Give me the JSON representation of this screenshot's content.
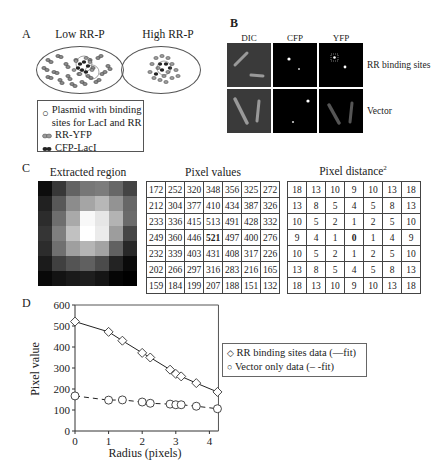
{
  "panel_a": {
    "letter": "A",
    "low_title": "Low RR-P",
    "high_title": "High RR-P",
    "legend": [
      {
        "icon": "open-circle-icon",
        "label": "Plasmid with binding sites for LacI and RR"
      },
      {
        "icon": "gray-dimer-icon",
        "label": "RR-YFP"
      },
      {
        "icon": "black-dimer-icon",
        "label": "CFP-LacI"
      }
    ],
    "legend_line1": "Plasmid with binding",
    "legend_line2": "sites for LacI and RR",
    "legend_rr": "RR-YFP",
    "legend_cfp": "CFP-LacI"
  },
  "panel_b": {
    "letter": "B",
    "columns": [
      "DIC",
      "CFP",
      "YFP"
    ],
    "rows": [
      "RR binding sites",
      "Vector"
    ]
  },
  "panel_c": {
    "letter": "C",
    "extracted_title": "Extracted region",
    "pixel_values_title": "Pixel values",
    "pixel_distance_title": "Pixel distance",
    "pixel_distance_sup": "2",
    "pixel_values": [
      [
        172,
        252,
        320,
        348,
        356,
        325,
        272
      ],
      [
        212,
        304,
        377,
        410,
        434,
        387,
        326
      ],
      [
        233,
        336,
        415,
        513,
        491,
        428,
        332
      ],
      [
        249,
        360,
        446,
        521,
        497,
        400,
        276
      ],
      [
        232,
        339,
        403,
        431,
        408,
        317,
        226
      ],
      [
        202,
        266,
        297,
        316,
        283,
        216,
        165
      ],
      [
        159,
        184,
        199,
        207,
        188,
        151,
        132
      ]
    ],
    "pixel_distance": [
      [
        18,
        13,
        10,
        9,
        10,
        13,
        18
      ],
      [
        13,
        8,
        5,
        4,
        5,
        8,
        13
      ],
      [
        10,
        5,
        2,
        1,
        2,
        5,
        10
      ],
      [
        9,
        4,
        1,
        0,
        1,
        4,
        9
      ],
      [
        10,
        5,
        2,
        1,
        2,
        5,
        10
      ],
      [
        13,
        8,
        5,
        4,
        5,
        8,
        13
      ],
      [
        18,
        13,
        10,
        9,
        10,
        13,
        18
      ]
    ],
    "bold_cell": [
      3,
      3
    ]
  },
  "panel_d": {
    "letter": "D",
    "legend_rr": "RR binding sites data (—fit)",
    "legend_vector": "Vector only data (– -fit)",
    "ylabel": "Pixel value",
    "xlabel": "Radius (pixels)"
  },
  "chart_data": {
    "type": "line",
    "title": "",
    "xlabel": "Radius (pixels)",
    "ylabel": "Pixel value",
    "xlim": [
      0,
      4.24
    ],
    "ylim": [
      0,
      600
    ],
    "xticks": [
      0,
      1,
      2,
      3,
      4
    ],
    "yticks": [
      0,
      100,
      200,
      300,
      400,
      500,
      600
    ],
    "grid": false,
    "legend_position": "right",
    "x": [
      0,
      1,
      1.41,
      2,
      2.24,
      2.83,
      3,
      3.16,
      3.61,
      4.24
    ],
    "series": [
      {
        "name": "RR binding sites data (—fit)",
        "marker": "diamond",
        "line": "solid",
        "values": [
          521,
          472,
          430,
          372,
          350,
          292,
          272,
          260,
          228,
          186
        ]
      },
      {
        "name": "Vector only data (– -fit)",
        "marker": "circle",
        "line": "dashed",
        "values": [
          167,
          147,
          148,
          138,
          132,
          128,
          125,
          125,
          118,
          106
        ]
      }
    ]
  }
}
